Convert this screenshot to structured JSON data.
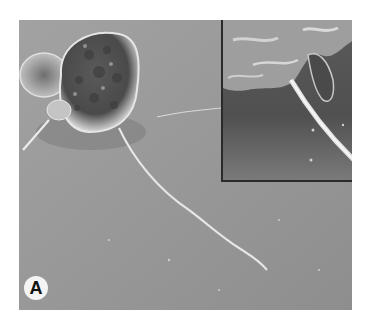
{
  "figure": {
    "panel_label": "A",
    "colors": {
      "background": "#9a9a9a",
      "inset_background": "#6a6a6a",
      "inset_border": "#2a2a2a",
      "label_circle": "#f4f4f4",
      "label_text": "#111111"
    },
    "inset": {
      "description": "Magnified view of a cell surface with a filament extending diagonally downward"
    }
  }
}
